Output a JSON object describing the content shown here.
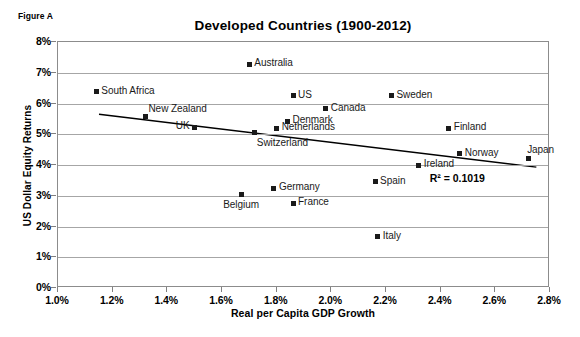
{
  "figure": {
    "caption": "Figure A"
  },
  "chart_data": {
    "type": "scatter",
    "title": "Developed Countries  (1900-2012)",
    "xlabel": "Real per Capita GDP Growth",
    "ylabel": "US Dollar Equity Returns",
    "xlim": [
      1.0,
      2.8
    ],
    "ylim": [
      0,
      8
    ],
    "xticks": [
      "1.0%",
      "1.2%",
      "1.4%",
      "1.6%",
      "1.8%",
      "2.0%",
      "2.2%",
      "2.4%",
      "2.6%",
      "2.8%"
    ],
    "xtick_values": [
      1.0,
      1.2,
      1.4,
      1.6,
      1.8,
      2.0,
      2.2,
      2.4,
      2.6,
      2.8
    ],
    "yticks": [
      "0%",
      "1%",
      "2%",
      "3%",
      "4%",
      "5%",
      "6%",
      "7%",
      "8%"
    ],
    "ytick_values": [
      0,
      1,
      2,
      3,
      4,
      5,
      6,
      7,
      8
    ],
    "grid": true,
    "legend": "none",
    "marker_color": "#1a1a1a",
    "gridline_color": "#a6a6a6",
    "points": [
      {
        "label": "South Africa",
        "x": 1.14,
        "y": 6.38,
        "label_pos": "right"
      },
      {
        "label": "New Zealand",
        "x": 1.32,
        "y": 5.58,
        "label_pos": "above-right"
      },
      {
        "label": "UK",
        "x": 1.5,
        "y": 5.22,
        "label_pos": "left"
      },
      {
        "label": "Australia",
        "x": 1.7,
        "y": 7.28,
        "label_pos": "right"
      },
      {
        "label": "Belgium",
        "x": 1.67,
        "y": 3.03,
        "label_pos": "below"
      },
      {
        "label": "Switzerland",
        "x": 1.72,
        "y": 5.05,
        "label_pos": "below-right"
      },
      {
        "label": "Germany",
        "x": 1.79,
        "y": 3.25,
        "label_pos": "right"
      },
      {
        "label": "Netherlands",
        "x": 1.8,
        "y": 5.2,
        "label_pos": "right"
      },
      {
        "label": "Denmark",
        "x": 1.84,
        "y": 5.43,
        "label_pos": "right"
      },
      {
        "label": "US",
        "x": 1.86,
        "y": 6.25,
        "label_pos": "right"
      },
      {
        "label": "France",
        "x": 1.86,
        "y": 2.75,
        "label_pos": "right"
      },
      {
        "label": "Canada",
        "x": 1.98,
        "y": 5.83,
        "label_pos": "right"
      },
      {
        "label": "Italy",
        "x": 2.17,
        "y": 1.66,
        "label_pos": "right"
      },
      {
        "label": "Spain",
        "x": 2.16,
        "y": 3.45,
        "label_pos": "right"
      },
      {
        "label": "Sweden",
        "x": 2.22,
        "y": 6.25,
        "label_pos": "right"
      },
      {
        "label": "Ireland",
        "x": 2.32,
        "y": 4.0,
        "label_pos": "right"
      },
      {
        "label": "Finland",
        "x": 2.43,
        "y": 5.2,
        "label_pos": "right"
      },
      {
        "label": "Norway",
        "x": 2.47,
        "y": 4.36,
        "label_pos": "right"
      },
      {
        "label": "Japan",
        "x": 2.72,
        "y": 4.22,
        "label_pos": "above"
      }
    ],
    "trendline": {
      "x_start": 1.15,
      "y_start": 5.65,
      "x_end": 2.75,
      "y_end": 3.93,
      "color": "#000000",
      "width": 1.4
    },
    "annotations": [
      {
        "name": "r-squared",
        "text": "R² = 0.1019",
        "x": 2.36,
        "y": 3.55
      }
    ]
  }
}
